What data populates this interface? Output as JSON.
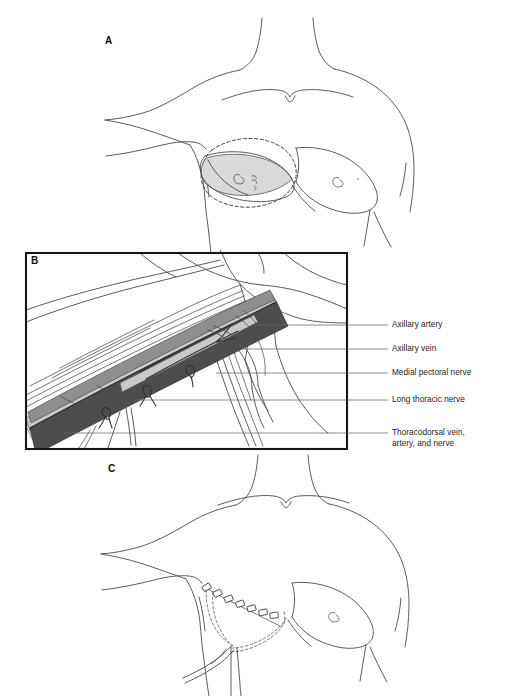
{
  "figure": {
    "background_color": "#ffffff",
    "line_color": "#4a4a4a",
    "dark_vessel_color": "#4d4d4d",
    "mid_vessel_color": "#8f8f8f",
    "light_vessel_color": "#c9c9c9",
    "shade_fill_color": "#d8d8d8",
    "frame_color": "#161616"
  },
  "panels": [
    {
      "id": "A",
      "letter": "A",
      "name": "preoperative-marking"
    },
    {
      "id": "B",
      "letter": "B",
      "name": "axillary-dissection-detail"
    },
    {
      "id": "C",
      "letter": "C",
      "name": "postoperative-closure"
    }
  ],
  "panel_b": {
    "letter": "B",
    "callouts": [
      {
        "id": "axillary-artery",
        "text": "Axillary artery",
        "leader_y": 325,
        "text_x": 392,
        "text_y": 320
      },
      {
        "id": "axillary-vein",
        "text": "Axillary vein",
        "leader_y": 349,
        "text_x": 392,
        "text_y": 344
      },
      {
        "id": "medial-pectoral-nerve",
        "text": "Medial pectoral nerve",
        "leader_y": 373,
        "text_x": 392,
        "text_y": 368
      },
      {
        "id": "long-thoracic-nerve",
        "text": "Long thoracic nerve",
        "leader_y": 400,
        "text_x": 392,
        "text_y": 395
      },
      {
        "id": "thoracodorsal-bundle",
        "text": "Thoracodorsal vein,\nartery, and nerve",
        "leader_y": 433,
        "text_x": 392,
        "text_y": 428
      }
    ]
  },
  "panel_a": {
    "letter": "A"
  },
  "panel_c": {
    "letter": "C"
  }
}
